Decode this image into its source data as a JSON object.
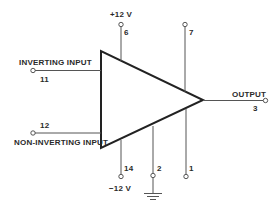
{
  "diagram": {
    "type": "operational-amplifier-pinout",
    "component": "op-amp triangle symbol",
    "pins": {
      "positive_supply": {
        "pin": "6",
        "label": "+12 V"
      },
      "pin_7": {
        "pin": "7"
      },
      "inverting_input": {
        "pin": "11",
        "label": "INVERTING INPUT"
      },
      "non_inverting_input": {
        "pin": "12",
        "label": "NON-INVERTING INPUT"
      },
      "negative_supply": {
        "pin": "14",
        "label": "−12 V"
      },
      "ground": {
        "pin": "2",
        "icon": "ground-icon"
      },
      "pin_1": {
        "pin": "1"
      },
      "output": {
        "pin": "3",
        "label": "OUTPUT"
      }
    },
    "colors": {
      "ink": "#222222",
      "background": "#ffffff"
    }
  }
}
